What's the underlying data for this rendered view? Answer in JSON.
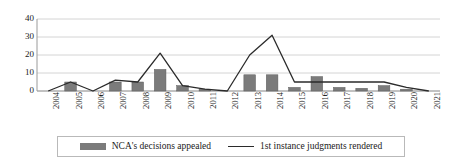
{
  "chart_data": {
    "type": "bar",
    "title": "",
    "subtitle": "",
    "xlabel": "",
    "ylabel": "",
    "ylim": [
      0,
      40
    ],
    "yticks": [
      0,
      10,
      20,
      30,
      40
    ],
    "grid": true,
    "legend_position": "bottom",
    "categories": [
      "2004",
      "2005",
      "2006",
      "2007",
      "2008",
      "2009",
      "2010",
      "2011",
      "2012",
      "2013",
      "2014",
      "2015",
      "2016",
      "2017",
      "2018",
      "2019",
      "2020",
      "2021"
    ],
    "series": [
      {
        "name": "NCA's decisions appealed",
        "type": "bar",
        "color": "#7b7b7b",
        "values": [
          0,
          5,
          0,
          5,
          5,
          12,
          3,
          1,
          0,
          9,
          9,
          2,
          8,
          2,
          1.5,
          3,
          1,
          0
        ]
      },
      {
        "name": "1st instance judgments rendered",
        "type": "line",
        "color": "#2b2b2b",
        "values": [
          0,
          5,
          0,
          6,
          5,
          21,
          3,
          1,
          0,
          20,
          31,
          5,
          5,
          5,
          5,
          5,
          2,
          0
        ]
      }
    ]
  },
  "legend": {
    "entries": [
      {
        "label": "NCA's decisions appealed",
        "marker": "bar-swatch"
      },
      {
        "label": "1st instance judgments rendered",
        "marker": "line-swatch"
      }
    ]
  },
  "colors": {
    "bar": "#7b7b7b",
    "line": "#2b2b2b",
    "gridline": "#d4d4d4",
    "axis": "#9a9a9a",
    "legend_border": "#b9b9b9",
    "background": "#ffffff"
  }
}
